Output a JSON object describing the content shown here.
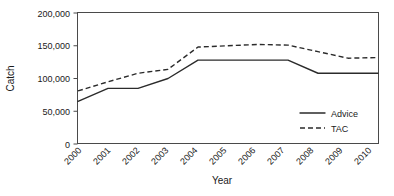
{
  "chart_data": {
    "type": "line",
    "title": "",
    "xlabel": "Year",
    "ylabel": "Catch",
    "x": [
      2000,
      2001,
      2002,
      2003,
      2004,
      2005,
      2006,
      2007,
      2008,
      2009,
      2010
    ],
    "categories": [
      "2000",
      "2001",
      "2002",
      "2003",
      "2004",
      "2005",
      "2006",
      "2007",
      "2008",
      "2009",
      "2010"
    ],
    "series": [
      {
        "name": "Advice",
        "style": "solid",
        "color": "#2b2b2b",
        "values": [
          65000,
          85000,
          85000,
          100000,
          128000,
          128000,
          128000,
          128000,
          108000,
          108000,
          108000
        ]
      },
      {
        "name": "TAC",
        "style": "dashed",
        "color": "#2b2b2b",
        "values": [
          81000,
          95000,
          108000,
          114000,
          148000,
          150000,
          152000,
          151000,
          141000,
          131000,
          132000
        ]
      }
    ],
    "ylim": [
      0,
      200000
    ],
    "yticks": [
      0,
      50000,
      100000,
      150000,
      200000
    ],
    "ytick_labels": [
      "0",
      "50,000",
      "100,000",
      "150,000",
      "200,000"
    ],
    "grid": false,
    "legend_position": "bottom-right",
    "legend_entries": [
      "Advice",
      "TAC"
    ]
  },
  "axes": {
    "y_title": "Catch",
    "x_title": "Year"
  },
  "legend": {
    "advice_label": "Advice",
    "tac_label": "TAC"
  }
}
